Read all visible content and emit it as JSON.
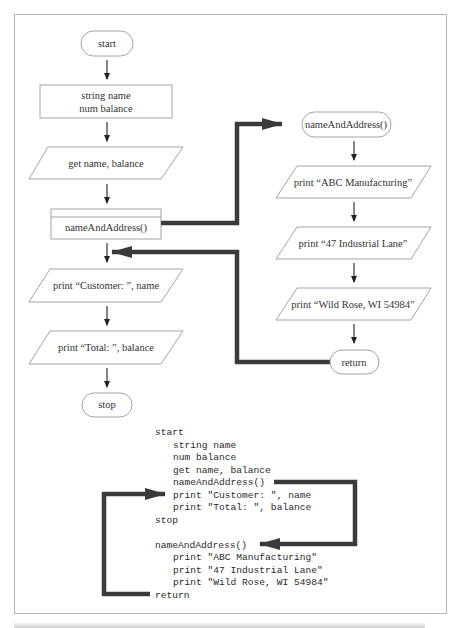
{
  "main_flowchart": {
    "start": "start",
    "declarations": [
      "string name",
      "num balance"
    ],
    "input": "get name, balance",
    "module_call": "nameAndAddress()",
    "output_customer": "print “Customer: ”, name",
    "output_total": "print “Total: ”, balance",
    "stop": "stop"
  },
  "module_flowchart": {
    "header": "nameAndAddress()",
    "print1": "print “ABC Manufacturing”",
    "print2": "print “47 Industrial Lane”",
    "print3": "print “Wild Rose, WI 54984”",
    "return": "return"
  },
  "pseudocode": {
    "lines": [
      {
        "indent": 0,
        "text": "start"
      },
      {
        "indent": 1,
        "text": "string name"
      },
      {
        "indent": 1,
        "text": "num balance"
      },
      {
        "indent": 1,
        "text": "get name, balance"
      },
      {
        "indent": 1,
        "text": "nameAndAddress()"
      },
      {
        "indent": 1,
        "text": "print \"Customer: \", name"
      },
      {
        "indent": 1,
        "text": "print \"Total: \", balance"
      },
      {
        "indent": 0,
        "text": "stop"
      },
      {
        "indent": 0,
        "text": ""
      },
      {
        "indent": 0,
        "text": "nameAndAddress()"
      },
      {
        "indent": 1,
        "text": "print \"ABC Manufacturing\""
      },
      {
        "indent": 1,
        "text": "print \"47 Industrial Lane\""
      },
      {
        "indent": 1,
        "text": "print \"Wild Rose, WI 54984\""
      },
      {
        "indent": 0,
        "text": "return"
      }
    ]
  },
  "colors": {
    "border": "#b5b5b5",
    "shape_stroke": "#9a9a9a",
    "thick_arrow": "#3a3a3a",
    "text": "#333333"
  }
}
